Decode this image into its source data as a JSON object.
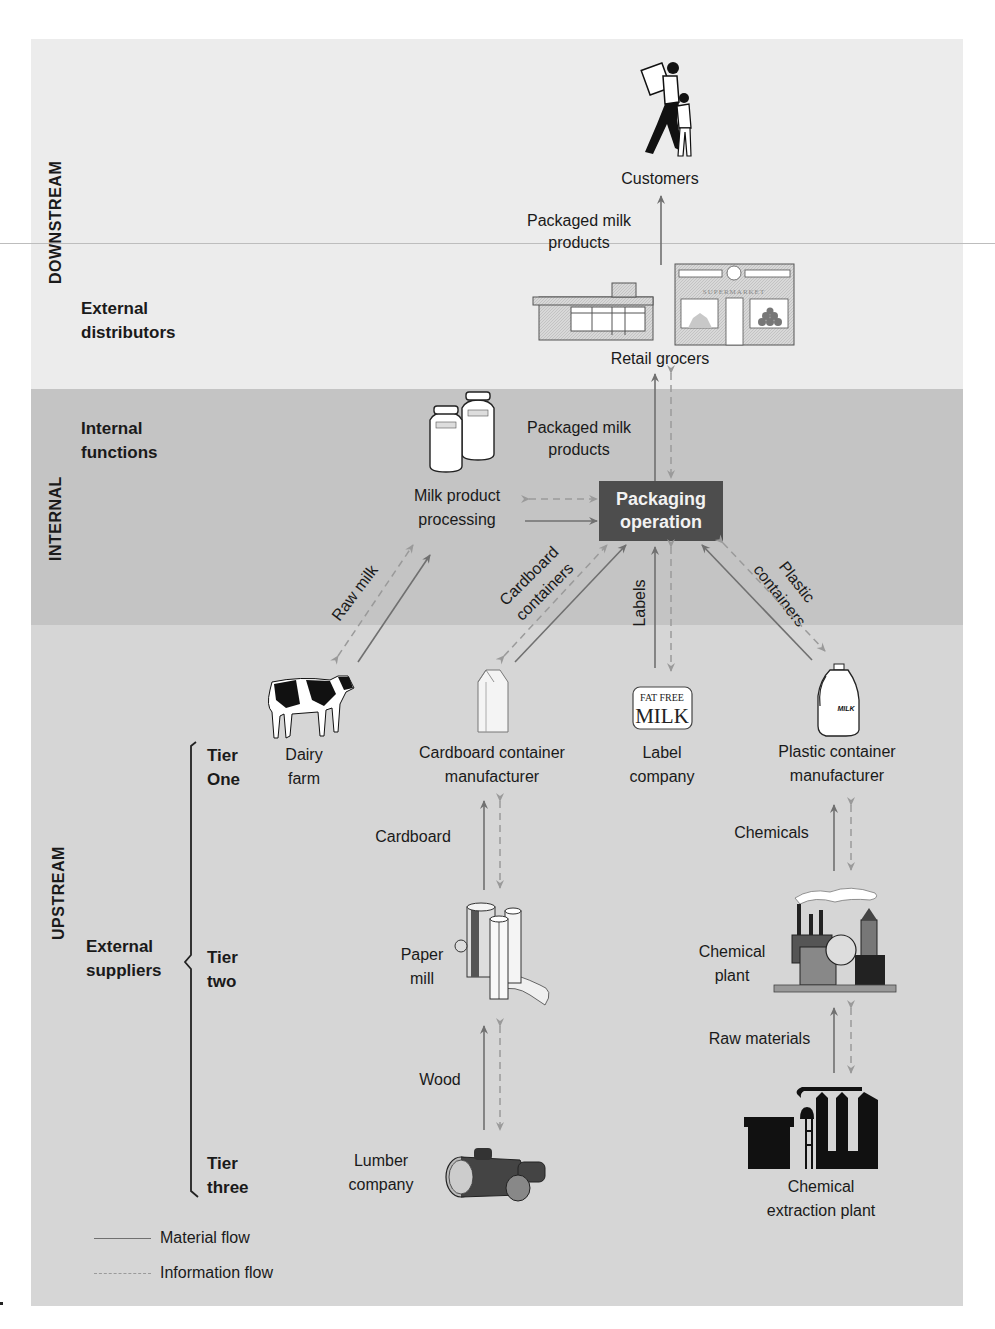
{
  "bands": {
    "downstream": {
      "label": "DOWNSTREAM",
      "group_label": "External\ndistributors",
      "color": "#ececec"
    },
    "internal": {
      "label": "INTERNAL",
      "group_label": "Internal\nfunctions",
      "color": "#c4c4c4"
    },
    "upstream": {
      "label": "UPSTREAM",
      "group_label": "External\nsuppliers",
      "color": "#d6d6d6"
    }
  },
  "tiers": [
    {
      "label": "Tier\nOne"
    },
    {
      "label": "Tier\ntwo"
    },
    {
      "label": "Tier\nthree"
    }
  ],
  "nodes": {
    "customers": {
      "label": "Customers",
      "icon": "customers-illustration"
    },
    "retail_grocers": {
      "label": "Retail grocers",
      "icon": "grocery-store-illustration",
      "store_sign": "SUPERMARKET"
    },
    "milk_processing": {
      "label": "Milk product\nprocessing",
      "icon": "milk-cans-illustration",
      "can_text": "MILK"
    },
    "packaging": {
      "label": "Packaging\noperation",
      "color": "#4d4d4d"
    },
    "dairy_farm": {
      "label": "Dairy\nfarm",
      "icon": "cow-illustration"
    },
    "cardboard_mfr": {
      "label": "Cardboard container\nmanufacturer",
      "icon": "milk-carton-illustration"
    },
    "label_company": {
      "label": "Label\ncompany",
      "icon": "milk-label-illustration",
      "label_text_top": "FAT FREE",
      "label_text_bottom": "MILK"
    },
    "plastic_mfr": {
      "label": "Plastic container\nmanufacturer",
      "icon": "milk-jug-illustration",
      "jug_text": "MILK"
    },
    "paper_mill": {
      "label": "Paper\nmill",
      "icon": "paper-rolls-illustration"
    },
    "chemical_plant": {
      "label": "Chemical\nplant",
      "icon": "factory-illustration"
    },
    "lumber_company": {
      "label": "Lumber\ncompany",
      "icon": "logs-illustration"
    },
    "extraction_plant": {
      "label": "Chemical\nextraction plant",
      "icon": "extraction-plant-illustration"
    }
  },
  "flows": {
    "retail_to_customers": "Packaged milk\nproducts",
    "packaging_to_retail": "Packaged milk\nproducts",
    "raw_milk": "Raw milk",
    "cardboard_containers": "Cardboard\ncontainers",
    "labels": "Labels",
    "plastic_containers": "Plastic\ncontainers",
    "cardboard": "Cardboard",
    "chemicals": "Chemicals",
    "wood": "Wood",
    "raw_materials": "Raw materials"
  },
  "legend": {
    "material": "Material flow",
    "information": "Information flow",
    "material_color": "#707070",
    "information_color": "#9a9a9a"
  }
}
